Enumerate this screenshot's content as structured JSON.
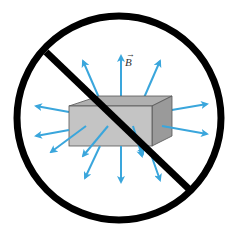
{
  "diagram": {
    "field_label": "B",
    "field_label_has_vector_arrow": true,
    "colors": {
      "arrow": "#3aa6dc",
      "prohibition": "#000000",
      "box_front": "#c4c4c4",
      "box_top": "#b0b0b0",
      "box_side": "#9a9a9a",
      "background": "#ffffff"
    },
    "elements": [
      {
        "type": "prohibition-sign",
        "shape": "circle with diagonal slash"
      },
      {
        "type": "box",
        "description": "rectangular bar magnet block (gray)"
      },
      {
        "type": "field-arrows",
        "count": 16,
        "direction": "radially outward"
      }
    ]
  }
}
